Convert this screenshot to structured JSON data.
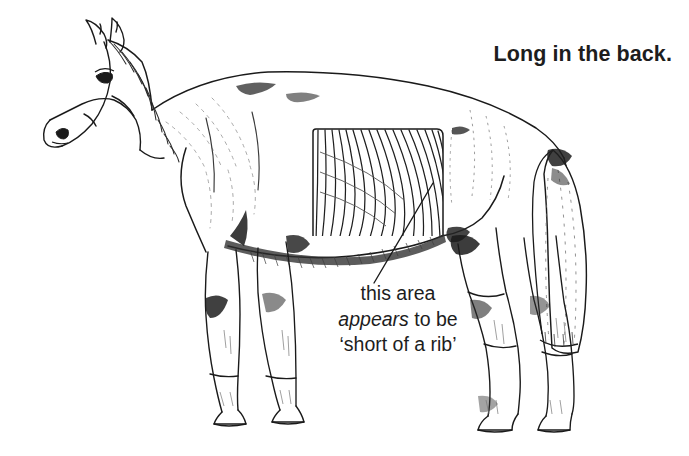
{
  "figure": {
    "kind": "pen-and-ink line drawing",
    "background_color": "#ffffff",
    "ink_color": "#1a1a1a"
  },
  "title": {
    "text": "Long in the back."
  },
  "caption": {
    "line1": "this area",
    "line2_em": "appears",
    "line2_rest": " to be",
    "line3": "‘short of a rib’"
  },
  "annotation": {
    "leader_line_label": "leader-line",
    "ribcage_box_label": "ribcage-highlight-box",
    "rib_count": 17
  },
  "colors": {
    "ink": "#1a1a1a",
    "ink_soft": "#4a4a4a",
    "ink_faint": "#8d8d8d",
    "background": "#ffffff",
    "text": "#1d1d1d"
  }
}
